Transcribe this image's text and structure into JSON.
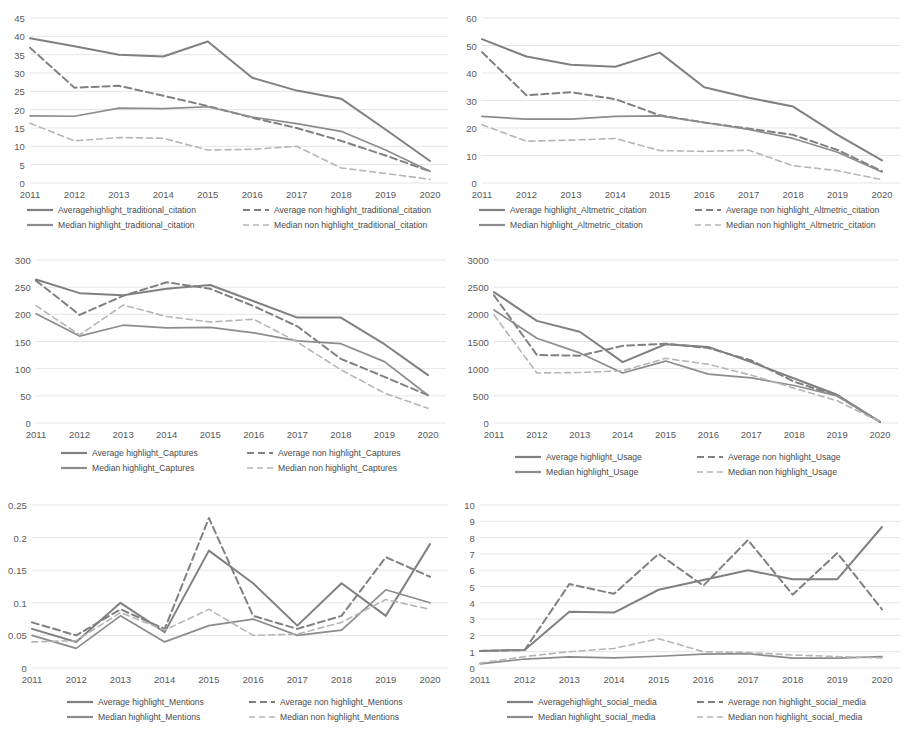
{
  "figure": {
    "background": "#ffffff",
    "panel_count": 6,
    "x_categories": [
      "2011",
      "2012",
      "2013",
      "2014",
      "2015",
      "2016",
      "2017",
      "2018",
      "2019",
      "2020"
    ],
    "colors": {
      "average_highlight": "#808080",
      "average_non_highlight": "#7a7a7a",
      "median_highlight": "#8c8c8c",
      "median_non_highlight": "#b5b5b5",
      "gridline": "#e2e2e2",
      "axis_text": "#595959"
    }
  },
  "chart_data": [
    {
      "id": "traditional-citation",
      "type": "line",
      "title": "",
      "xlabel": "",
      "ylabel": "",
      "grid": true,
      "legend_position": "bottom",
      "categories": [
        "2011",
        "2012",
        "2013",
        "2014",
        "2015",
        "2016",
        "2017",
        "2018",
        "2019",
        "2020"
      ],
      "ylim": [
        0,
        45
      ],
      "yticks": [
        0,
        5,
        10,
        15,
        20,
        25,
        30,
        35,
        40,
        45
      ],
      "ytick_labels": [
        "0",
        "5",
        "10",
        "15",
        "20",
        "25",
        "30",
        "35",
        "40",
        "45"
      ],
      "series": [
        {
          "name": "Averagehighlight_traditional_citation",
          "style": "solid",
          "shade": "dark",
          "values": [
            39.5,
            37.3,
            35.0,
            34.5,
            38.6,
            28.7,
            25.2,
            23.0,
            14.6,
            6.0
          ]
        },
        {
          "name": "Average non highlight_traditional_citation",
          "style": "dashed",
          "shade": "dark",
          "values": [
            36.9,
            26.0,
            26.5,
            23.8,
            21.0,
            17.8,
            15.0,
            11.5,
            7.5,
            3.2
          ]
        },
        {
          "name": "Median highlight_traditional_citation",
          "style": "solid",
          "shade": "mid",
          "values": [
            18.3,
            18.2,
            20.4,
            20.3,
            20.8,
            18.0,
            16.2,
            14.1,
            9.0,
            3.2
          ]
        },
        {
          "name": "Median non highlight_traditional_citation",
          "style": "dashed",
          "shade": "light",
          "values": [
            16.3,
            11.5,
            12.4,
            12.2,
            9.0,
            9.2,
            10.0,
            4.1,
            2.6,
            1.0
          ]
        }
      ]
    },
    {
      "id": "altmetric-citation",
      "type": "line",
      "title": "",
      "xlabel": "",
      "ylabel": "",
      "grid": true,
      "legend_position": "bottom",
      "categories": [
        "2011",
        "2012",
        "2013",
        "2014",
        "2015",
        "2016",
        "2017",
        "2018",
        "2019",
        "2020"
      ],
      "ylim": [
        0,
        60
      ],
      "yticks": [
        0,
        10,
        20,
        30,
        40,
        50,
        60
      ],
      "ytick_labels": [
        "0",
        "10",
        "20",
        "30",
        "40",
        "50",
        "60"
      ],
      "series": [
        {
          "name": "Average highlight_Altmetric_citation",
          "style": "solid",
          "shade": "dark",
          "values": [
            52.3,
            46.0,
            43.0,
            42.3,
            47.4,
            34.8,
            31.0,
            27.8,
            17.5,
            8.2
          ]
        },
        {
          "name": "Average non highlight_Altmetric_citation",
          "style": "dashed",
          "shade": "dark",
          "values": [
            47.6,
            31.9,
            33.0,
            30.5,
            24.6,
            22.0,
            19.8,
            17.5,
            12.0,
            4.3
          ]
        },
        {
          "name": "Median highlight_Altmetric_citation",
          "style": "solid",
          "shade": "mid",
          "values": [
            24.2,
            23.2,
            23.2,
            24.2,
            24.4,
            22.0,
            19.5,
            16.2,
            11.2,
            4.0
          ]
        },
        {
          "name": "Median non highlight_Altmetric_citation",
          "style": "dashed",
          "shade": "light",
          "values": [
            21.2,
            15.2,
            15.6,
            16.2,
            11.8,
            11.5,
            11.9,
            6.3,
            4.5,
            1.2
          ]
        }
      ]
    },
    {
      "id": "captures",
      "type": "line",
      "title": "",
      "xlabel": "",
      "ylabel": "",
      "grid": true,
      "legend_position": "bottom",
      "categories": [
        "2011",
        "2012",
        "2013",
        "2014",
        "2015",
        "2016",
        "2017",
        "2018",
        "2019",
        "2020"
      ],
      "ylim": [
        0,
        300
      ],
      "yticks": [
        0,
        50,
        100,
        150,
        200,
        250,
        300
      ],
      "ytick_labels": [
        "0",
        "50",
        "100",
        "150",
        "200",
        "250",
        "300"
      ],
      "series": [
        {
          "name": "Average highlight_Captures",
          "style": "solid",
          "shade": "dark",
          "values": [
            264,
            239,
            235,
            247,
            254,
            224,
            194,
            194,
            145,
            88
          ]
        },
        {
          "name": "Average non highlight_Captures",
          "style": "dashed",
          "shade": "dark",
          "values": [
            262,
            199,
            234,
            259,
            247,
            215,
            178,
            118,
            85,
            51
          ]
        },
        {
          "name": "Median highlight_Captures",
          "style": "solid",
          "shade": "mid",
          "values": [
            201,
            160,
            180,
            175,
            176,
            166,
            151,
            146,
            113,
            51
          ]
        },
        {
          "name": "Median non highlight_Captures",
          "style": "dashed",
          "shade": "light",
          "values": [
            216,
            162,
            217,
            196,
            186,
            191,
            149,
            98,
            55,
            27
          ]
        }
      ]
    },
    {
      "id": "usage",
      "type": "line",
      "title": "",
      "xlabel": "",
      "ylabel": "",
      "grid": true,
      "legend_position": "bottom",
      "categories": [
        "2011",
        "2012",
        "2013",
        "2014",
        "2015",
        "2016",
        "2017",
        "2018",
        "2019",
        "2020"
      ],
      "ylim": [
        0,
        3000
      ],
      "yticks": [
        0,
        500,
        1000,
        1500,
        2000,
        2500,
        3000
      ],
      "ytick_labels": [
        "0",
        "500",
        "1000",
        "1500",
        "2000",
        "2500",
        "3000"
      ],
      "series": [
        {
          "name": "Average highlight_Usage",
          "style": "solid",
          "shade": "dark",
          "values": [
            2410,
            1880,
            1680,
            1120,
            1450,
            1400,
            1120,
            820,
            520,
            20
          ]
        },
        {
          "name": "Average non highlight_Usage",
          "style": "dashed",
          "shade": "dark",
          "values": [
            2350,
            1250,
            1240,
            1420,
            1460,
            1380,
            1150,
            760,
            500,
            20
          ]
        },
        {
          "name": "Median highlight_Usage",
          "style": "solid",
          "shade": "mid",
          "values": [
            2080,
            1560,
            1290,
            920,
            1140,
            900,
            830,
            690,
            500,
            20
          ]
        },
        {
          "name": "Median non highlight_Usage",
          "style": "dashed",
          "shade": "light",
          "values": [
            1990,
            920,
            930,
            960,
            1190,
            1080,
            880,
            640,
            410,
            20
          ]
        }
      ]
    },
    {
      "id": "mentions",
      "type": "line",
      "title": "",
      "xlabel": "",
      "ylabel": "",
      "grid": true,
      "legend_position": "bottom",
      "categories": [
        "2011",
        "2012",
        "2013",
        "2014",
        "2015",
        "2016",
        "2017",
        "2018",
        "2019",
        "2020"
      ],
      "ylim": [
        0,
        0.25
      ],
      "yticks": [
        0,
        0.05,
        0.1,
        0.15,
        0.2,
        0.25
      ],
      "ytick_labels": [
        "0",
        "0.05",
        "0.1",
        "0.15",
        "0.2",
        "0.25"
      ],
      "series": [
        {
          "name": "Average highlight_Mentions",
          "style": "solid",
          "shade": "dark",
          "values": [
            0.06,
            0.04,
            0.1,
            0.055,
            0.18,
            0.13,
            0.065,
            0.13,
            0.08,
            0.19
          ]
        },
        {
          "name": "Average non highlight_Mentions",
          "style": "dashed",
          "shade": "dark",
          "values": [
            0.07,
            0.05,
            0.09,
            0.06,
            0.23,
            0.08,
            0.06,
            0.08,
            0.17,
            0.14
          ]
        },
        {
          "name": "Median highlight_Mentions",
          "style": "solid",
          "shade": "mid",
          "values": [
            0.05,
            0.03,
            0.08,
            0.04,
            0.065,
            0.075,
            0.05,
            0.058,
            0.12,
            0.1
          ]
        },
        {
          "name": "Median non highlight_Mentions",
          "style": "dashed",
          "shade": "light",
          "values": [
            0.04,
            0.042,
            0.085,
            0.058,
            0.09,
            0.05,
            0.052,
            0.07,
            0.105,
            0.09
          ]
        }
      ]
    },
    {
      "id": "social-media",
      "type": "line",
      "title": "",
      "xlabel": "",
      "ylabel": "",
      "grid": true,
      "legend_position": "bottom",
      "categories": [
        "2011",
        "2012",
        "2013",
        "2014",
        "2015",
        "2016",
        "2017",
        "2018",
        "2019",
        "2020"
      ],
      "ylim": [
        0,
        10
      ],
      "yticks": [
        0,
        1,
        2,
        3,
        4,
        5,
        6,
        7,
        8,
        9,
        10
      ],
      "ytick_labels": [
        "0",
        "1",
        "2",
        "3",
        "4",
        "5",
        "6",
        "7",
        "8",
        "9",
        "10"
      ],
      "series": [
        {
          "name": "Averagehighlight_social_media",
          "style": "solid",
          "shade": "dark",
          "values": [
            1.05,
            1.1,
            3.45,
            3.4,
            4.8,
            5.4,
            6.0,
            5.45,
            5.45,
            8.65
          ]
        },
        {
          "name": "Average non highlight_social_media",
          "style": "dashed",
          "shade": "dark",
          "values": [
            1.05,
            1.1,
            5.15,
            4.55,
            7.0,
            5.05,
            7.85,
            4.5,
            7.05,
            3.6
          ]
        },
        {
          "name": "Median highlight_social_media",
          "style": "solid",
          "shade": "mid",
          "values": [
            0.25,
            0.55,
            0.68,
            0.62,
            0.72,
            0.85,
            0.88,
            0.6,
            0.6,
            0.7
          ]
        },
        {
          "name": "Median non highlight_social_media",
          "style": "dashed",
          "shade": "light",
          "values": [
            0.3,
            0.7,
            1.0,
            1.2,
            1.8,
            1.0,
            0.95,
            0.8,
            0.7,
            0.62
          ]
        }
      ]
    }
  ]
}
